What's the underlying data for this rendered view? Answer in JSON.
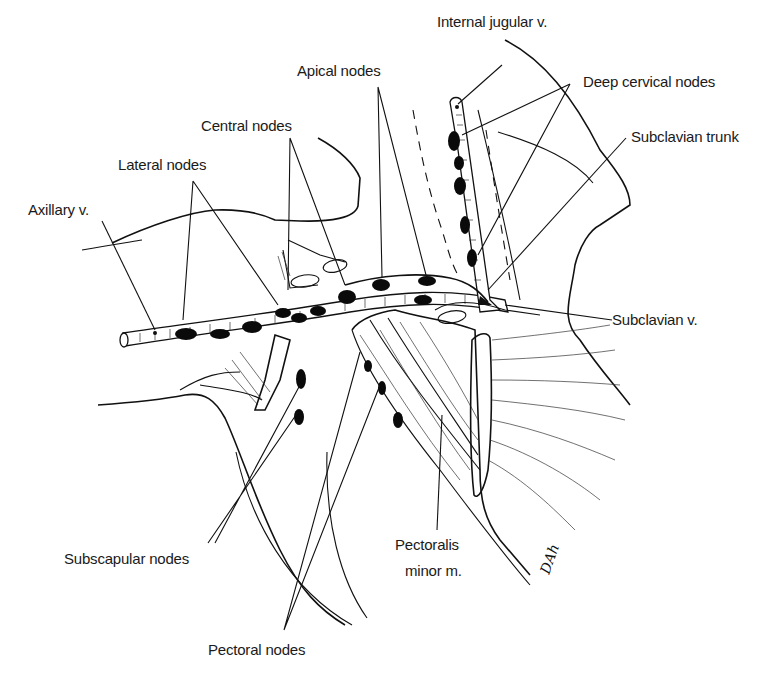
{
  "figure": {
    "labels": {
      "internal_jugular": "Internal jugular v.",
      "apical": "Apical nodes",
      "deep_cervical": "Deep cervical nodes",
      "central": "Central nodes",
      "subclavian_trunk": "Subclavian trunk",
      "lateral": "Lateral nodes",
      "axillary_v": "Axillary v.",
      "subclavian_v": "Subclavian v.",
      "subscapular": "Subscapular nodes",
      "pectoralis_line1": "Pectoralis",
      "pectoralis_line2": "minor m.",
      "pectoral": "Pectoral nodes"
    },
    "signature": "DAh",
    "colors": {
      "ink": "#111111",
      "background": "#ffffff"
    }
  }
}
